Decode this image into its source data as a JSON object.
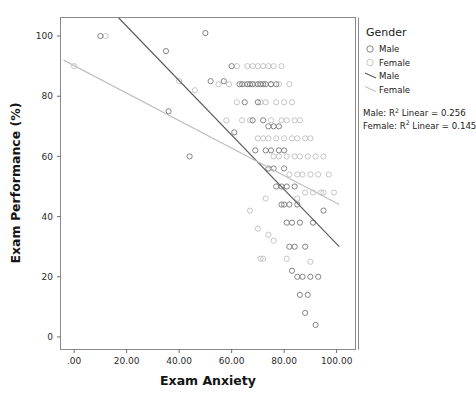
{
  "chart_data": {
    "type": "scatter",
    "title": "",
    "xlabel": "Exam Anxiety",
    "ylabel": "Exam Performance (%)",
    "xlim": [
      -5,
      107
    ],
    "ylim": [
      -4,
      106
    ],
    "xticks": [
      ".00",
      "20.00",
      "40.00",
      "60.00",
      "80.00",
      "100.00"
    ],
    "xtick_values": [
      0,
      20,
      40,
      60,
      80,
      100
    ],
    "yticks": [
      "0",
      "20",
      "40",
      "60",
      "80",
      "100"
    ],
    "ytick_values": [
      0,
      20,
      40,
      60,
      80,
      100
    ],
    "grid": false,
    "legend_position": "right",
    "legend_title": "Gender",
    "legend_entries": [
      {
        "label": "Male",
        "kind": "marker",
        "color": "#7d7d7d"
      },
      {
        "label": "Female",
        "kind": "marker",
        "color": "#c2c2c2"
      },
      {
        "label": "Male",
        "kind": "line",
        "color": "#5b5b5b"
      },
      {
        "label": "Female",
        "kind": "line",
        "color": "#c0c0c0"
      }
    ],
    "annotations": [
      {
        "text_prefix": "Male: R",
        "sup": "2",
        "text_suffix": " Linear = 0.256"
      },
      {
        "text_prefix": "Female: R",
        "sup": "2",
        "text_suffix": " Linear = 0.145"
      }
    ],
    "fit_lines": [
      {
        "name": "Male",
        "r_squared": 0.256,
        "color": "#5b5b5b",
        "x_start": 17.0,
        "y_start": 106.0,
        "x_end": 101.0,
        "y_end": 30.0
      },
      {
        "name": "Female",
        "r_squared": 0.145,
        "color": "#c0c0c0",
        "x_start": -4.0,
        "y_start": 92.0,
        "x_end": 101.0,
        "y_end": 44.0
      }
    ],
    "series": [
      {
        "name": "Male",
        "color": "#7d7d7d",
        "points": [
          [
            10,
            100
          ],
          [
            35,
            95
          ],
          [
            36,
            75
          ],
          [
            44,
            60
          ],
          [
            50,
            101
          ],
          [
            52,
            85
          ],
          [
            57,
            85
          ],
          [
            60,
            90
          ],
          [
            61,
            68
          ],
          [
            63,
            84
          ],
          [
            64,
            84
          ],
          [
            65,
            78
          ],
          [
            66,
            84
          ],
          [
            67,
            84
          ],
          [
            68,
            84
          ],
          [
            68,
            72
          ],
          [
            69,
            62
          ],
          [
            70,
            84
          ],
          [
            70,
            78
          ],
          [
            71,
            84
          ],
          [
            72,
            84
          ],
          [
            72,
            72
          ],
          [
            73,
            62
          ],
          [
            73,
            84
          ],
          [
            74,
            56
          ],
          [
            74,
            70
          ],
          [
            75,
            84
          ],
          [
            75,
            62
          ],
          [
            76,
            70
          ],
          [
            76,
            56
          ],
          [
            77,
            84
          ],
          [
            77,
            50
          ],
          [
            78,
            62
          ],
          [
            78,
            70
          ],
          [
            79,
            50
          ],
          [
            79,
            44
          ],
          [
            80,
            62
          ],
          [
            80,
            56
          ],
          [
            80,
            44
          ],
          [
            81,
            50
          ],
          [
            81,
            38
          ],
          [
            82,
            44
          ],
          [
            82,
            30
          ],
          [
            83,
            38
          ],
          [
            83,
            22
          ],
          [
            84,
            50
          ],
          [
            84,
            30
          ],
          [
            85,
            20
          ],
          [
            85,
            44
          ],
          [
            86,
            14
          ],
          [
            86,
            38
          ],
          [
            87,
            20
          ],
          [
            88,
            8
          ],
          [
            88,
            30
          ],
          [
            89,
            14
          ],
          [
            90,
            20
          ],
          [
            91,
            38
          ],
          [
            92,
            4
          ],
          [
            93,
            20
          ],
          [
            95,
            42
          ]
        ]
      },
      {
        "name": "Female",
        "color": "#c2c2c2",
        "points": [
          [
            0,
            90
          ],
          [
            12,
            100
          ],
          [
            40,
            85
          ],
          [
            46,
            82
          ],
          [
            55,
            84
          ],
          [
            58,
            72
          ],
          [
            59,
            84
          ],
          [
            62,
            78
          ],
          [
            62,
            90
          ],
          [
            64,
            72
          ],
          [
            65,
            84
          ],
          [
            66,
            90
          ],
          [
            67,
            72
          ],
          [
            68,
            90
          ],
          [
            69,
            84
          ],
          [
            70,
            90
          ],
          [
            70,
            66
          ],
          [
            71,
            78
          ],
          [
            72,
            90
          ],
          [
            72,
            66
          ],
          [
            73,
            78
          ],
          [
            74,
            90
          ],
          [
            74,
            66
          ],
          [
            75,
            84
          ],
          [
            75,
            72
          ],
          [
            76,
            90
          ],
          [
            76,
            60
          ],
          [
            77,
            78
          ],
          [
            77,
            66
          ],
          [
            78,
            84
          ],
          [
            78,
            60
          ],
          [
            79,
            72
          ],
          [
            79,
            90
          ],
          [
            80,
            66
          ],
          [
            80,
            78
          ],
          [
            81,
            60
          ],
          [
            81,
            72
          ],
          [
            82,
            84
          ],
          [
            82,
            54
          ],
          [
            83,
            66
          ],
          [
            83,
            78
          ],
          [
            84,
            60
          ],
          [
            84,
            72
          ],
          [
            85,
            54
          ],
          [
            85,
            66
          ],
          [
            86,
            72
          ],
          [
            86,
            60
          ],
          [
            87,
            54
          ],
          [
            88,
            66
          ],
          [
            88,
            48
          ],
          [
            89,
            60
          ],
          [
            90,
            54
          ],
          [
            90,
            66
          ],
          [
            91,
            48
          ],
          [
            92,
            60
          ],
          [
            93,
            54
          ],
          [
            94,
            48
          ],
          [
            95,
            60
          ],
          [
            97,
            54
          ],
          [
            99,
            48
          ],
          [
            71,
            26
          ],
          [
            72,
            26
          ],
          [
            74,
            34
          ],
          [
            76,
            32
          ],
          [
            81,
            26
          ],
          [
            90,
            25
          ],
          [
            67,
            42
          ],
          [
            70,
            36
          ],
          [
            73,
            46
          ],
          [
            85,
            46
          ],
          [
            95,
            48
          ]
        ]
      }
    ]
  }
}
